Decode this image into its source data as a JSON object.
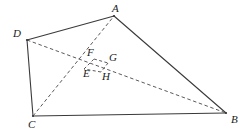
{
  "figure": {
    "type": "geometry-diagram",
    "canvas": {
      "width": 245,
      "height": 137
    },
    "colors": {
      "solid_stroke": "#3a3a3a",
      "dashed_stroke": "#5a5a5a",
      "label_color": "#1a1a1a",
      "background": "#ffffff"
    },
    "points": [
      {
        "id": "A",
        "label": "A",
        "x": 114,
        "y": 16,
        "label_x": 112,
        "label_y": 3
      },
      {
        "id": "B",
        "label": "B",
        "x": 226,
        "y": 113,
        "label_x": 231,
        "label_y": 114
      },
      {
        "id": "C",
        "label": "C",
        "x": 33,
        "y": 116,
        "label_x": 28,
        "label_y": 119
      },
      {
        "id": "D",
        "label": "D",
        "x": 27,
        "y": 40,
        "label_x": 13,
        "label_y": 28
      },
      {
        "id": "E",
        "label": "E",
        "x": 84,
        "y": 69,
        "label_x": 83,
        "label_y": 68
      },
      {
        "id": "F",
        "label": "F",
        "x": 94,
        "y": 59,
        "label_x": 87,
        "label_y": 47
      },
      {
        "id": "G",
        "label": "G",
        "x": 108,
        "y": 63,
        "label_x": 109,
        "label_y": 52
      },
      {
        "id": "H",
        "label": "H",
        "x": 101,
        "y": 72,
        "label_x": 102,
        "label_y": 71
      }
    ],
    "solid_edges": [
      {
        "name": "edge-DA",
        "from": "D",
        "to": "A"
      },
      {
        "name": "edge-AB",
        "from": "A",
        "to": "B"
      },
      {
        "name": "edge-BC",
        "from": "B",
        "to": "C"
      },
      {
        "name": "edge-CD",
        "from": "C",
        "to": "D"
      }
    ],
    "dashed_edges": [
      {
        "name": "diagonal-DB",
        "from": "D",
        "to": "B"
      },
      {
        "name": "diagonal-CA",
        "from": "C",
        "to": "A"
      },
      {
        "name": "segment-EF",
        "from": "E",
        "to": "F"
      },
      {
        "name": "segment-FG",
        "from": "F",
        "to": "G"
      },
      {
        "name": "segment-GH",
        "from": "G",
        "to": "H"
      },
      {
        "name": "segment-HE",
        "from": "H",
        "to": "E"
      }
    ]
  }
}
